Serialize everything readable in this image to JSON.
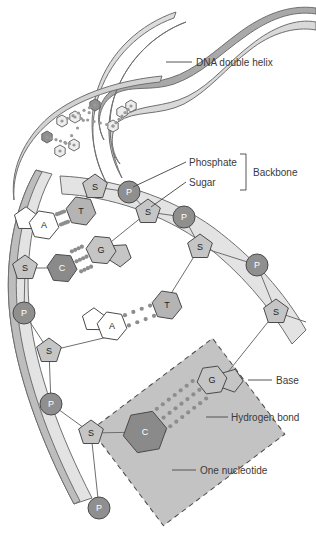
{
  "figure": {
    "colors": {
      "ribbon_front": "#d2d2d2",
      "ribbon_back": "#a9a9a9",
      "ribbon_light": "#e2e2e2",
      "sugar_fill": "#c5c5c5",
      "phosphate_fill": "#8f8f8f",
      "base_light": "#ffffff",
      "base_mid": "#b4b4b4",
      "base_dark": "#8a8a8a",
      "nucleotide_box": "#b9b9b9",
      "hydrogen_bond": "#8d8d8d",
      "outline": "#4a4a4a",
      "label_text": "#3a3a3a"
    }
  },
  "labels": {
    "dna_double_helix": "DNA double helix",
    "phosphate": "Phosphate",
    "sugar": "Sugar",
    "backbone": "Backbone",
    "base": "Base",
    "hydrogen_bond": "Hydrogen bond",
    "one_nucleotide": "One nucleotide"
  },
  "units": {
    "sugar": "S",
    "phosphate": "P"
  },
  "backbone_right": [
    {
      "type": "sugar",
      "label": "S",
      "x": 95,
      "y": 187
    },
    {
      "type": "phosphate",
      "label": "P",
      "x": 129,
      "y": 192
    },
    {
      "type": "sugar",
      "label": "S",
      "x": 148,
      "y": 212
    },
    {
      "type": "phosphate",
      "label": "P",
      "x": 184,
      "y": 217
    },
    {
      "type": "sugar",
      "label": "S",
      "x": 200,
      "y": 247
    },
    {
      "type": "phosphate",
      "label": "P",
      "x": 257,
      "y": 265
    },
    {
      "type": "sugar",
      "label": "S",
      "x": 276,
      "y": 312
    }
  ],
  "backbone_left": [
    {
      "type": "sugar",
      "label": "S",
      "x": 25,
      "y": 268
    },
    {
      "type": "phosphate",
      "label": "P",
      "x": 24,
      "y": 313
    },
    {
      "type": "sugar",
      "label": "S",
      "x": 49,
      "y": 351
    },
    {
      "type": "phosphate",
      "label": "P",
      "x": 51,
      "y": 404
    },
    {
      "type": "sugar",
      "label": "S",
      "x": 91,
      "y": 433
    },
    {
      "type": "phosphate",
      "label": "P",
      "x": 99,
      "y": 508
    }
  ],
  "base_pairs": [
    {
      "left": "A",
      "left_type": "purine",
      "right": "T",
      "right_type": "pyrimidine",
      "left_x": 44,
      "left_y": 225,
      "right_x": 81,
      "right_y": 211,
      "bonds": 2
    },
    {
      "left": "C",
      "left_type": "pyrimidine",
      "right": "G",
      "right_type": "purine",
      "left_x": 62,
      "left_y": 268,
      "right_x": 101,
      "right_y": 250,
      "bonds": 3
    },
    {
      "left": "A",
      "left_type": "purine",
      "right": "T",
      "right_type": "pyrimidine",
      "left_x": 112,
      "left_y": 326,
      "right_x": 167,
      "right_y": 305,
      "bonds": 2
    },
    {
      "left": "C",
      "left_type": "pyrimidine",
      "right": "G",
      "right_type": "purine",
      "left_x": 145,
      "left_y": 432,
      "right_x": 212,
      "right_y": 380,
      "bonds": 3
    }
  ],
  "nucleotide_box": {
    "rotation_deg": -37,
    "dashed": true
  },
  "helix_bases_top": [
    {
      "x": 47,
      "y": 137,
      "tone": "dark"
    },
    {
      "x": 62,
      "y": 121,
      "tone": "light"
    },
    {
      "x": 74,
      "y": 145,
      "tone": "light"
    },
    {
      "x": 60,
      "y": 151,
      "tone": "light"
    },
    {
      "x": 95,
      "y": 105,
      "tone": "dark"
    },
    {
      "x": 113,
      "y": 126,
      "tone": "light"
    },
    {
      "x": 75,
      "y": 117,
      "tone": "light"
    },
    {
      "x": 131,
      "y": 106,
      "tone": "light"
    },
    {
      "x": 122,
      "y": 112,
      "tone": "light"
    }
  ]
}
